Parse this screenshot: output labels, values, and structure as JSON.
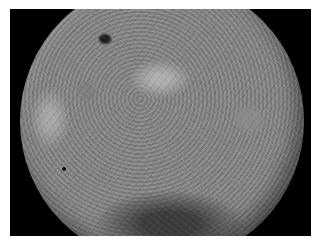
{
  "image": {
    "subject": "Far side of the Moon",
    "description": "Grayscale photograph of a heavily cratered lunar surface on a black background, framed by a thin white border",
    "colors": {
      "border": "#ffffff",
      "background": "#000000",
      "surface_mid": "#8a8a8a",
      "crater_dark": "#1e1e1e"
    }
  }
}
